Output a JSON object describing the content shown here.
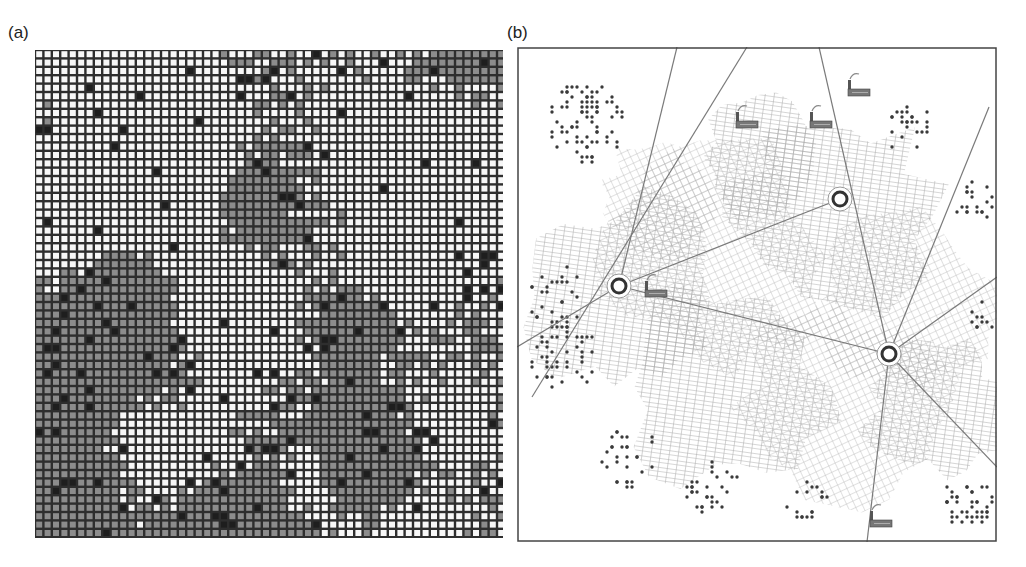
{
  "figure": {
    "panel_a": {
      "label": "(a)",
      "title": "cellular automaton land-use grid",
      "grid": {
        "cols": 56,
        "rows": 58,
        "cell_pitch_px": 8.4,
        "cell_gap_px": 2.4,
        "seed": 7,
        "colors": {
          "border": "#2e2e2e",
          "empty": "#f7f7f7",
          "developed": "#8c8c8c",
          "dense": "#1e1e1e"
        },
        "proportions": {
          "empty": 0.5,
          "developed": 0.44,
          "dense": 0.06
        }
      }
    },
    "panel_b": {
      "label": "(b)",
      "title": "urban growth network map",
      "frame_color": "#444444",
      "mesh_color": "#a8a8a8",
      "dot_color": "#3a3a3a",
      "road_color": "#7a7a7a",
      "centers": [
        {
          "name": "center-west",
          "x": 102,
          "y": 239
        },
        {
          "name": "center-north",
          "x": 323,
          "y": 152
        },
        {
          "name": "center-east",
          "x": 372,
          "y": 307
        }
      ],
      "factories": [
        {
          "name": "factory-1",
          "x": 219,
          "y": 69
        },
        {
          "name": "factory-2",
          "x": 331,
          "y": 37
        },
        {
          "name": "factory-3",
          "x": 293,
          "y": 69
        },
        {
          "name": "factory-4",
          "x": 128,
          "y": 238
        },
        {
          "name": "factory-5",
          "x": 353,
          "y": 468
        }
      ],
      "roads": [
        {
          "from": [
            160,
            0
          ],
          "to": [
            102,
            239
          ]
        },
        {
          "from": [
            230,
            0
          ],
          "to": [
            15,
            350
          ]
        },
        {
          "from": [
            302,
            0
          ],
          "to": [
            372,
            307
          ]
        },
        {
          "from": [
            472,
            60
          ],
          "to": [
            372,
            307
          ]
        },
        {
          "from": [
            102,
            239
          ],
          "to": [
            372,
            307
          ]
        },
        {
          "from": [
            102,
            239
          ],
          "to": [
            323,
            152
          ]
        },
        {
          "from": [
            372,
            307
          ],
          "to": [
            350,
            495
          ]
        },
        {
          "from": [
            372,
            307
          ],
          "to": [
            480,
            420
          ]
        },
        {
          "from": [
            372,
            307
          ],
          "to": [
            480,
            230
          ]
        },
        {
          "from": [
            102,
            239
          ],
          "to": [
            0,
            300
          ]
        }
      ],
      "mesh_blobs": [
        {
          "cx": 110,
          "cy": 250,
          "r": 95
        },
        {
          "cx": 200,
          "cy": 210,
          "r": 110
        },
        {
          "cx": 320,
          "cy": 170,
          "r": 100
        },
        {
          "cx": 390,
          "cy": 260,
          "r": 90
        },
        {
          "cx": 210,
          "cy": 340,
          "r": 100
        },
        {
          "cx": 330,
          "cy": 360,
          "r": 100
        },
        {
          "cx": 420,
          "cy": 360,
          "r": 70
        },
        {
          "cx": 140,
          "cy": 150,
          "r": 55
        },
        {
          "cx": 250,
          "cy": 110,
          "r": 60
        }
      ],
      "dot_clusters": [
        {
          "cx": 70,
          "cy": 75,
          "r": 40,
          "n": 80
        },
        {
          "cx": 40,
          "cy": 250,
          "r": 30,
          "n": 30
        },
        {
          "cx": 45,
          "cy": 310,
          "r": 35,
          "n": 45
        },
        {
          "cx": 110,
          "cy": 410,
          "r": 30,
          "n": 30
        },
        {
          "cx": 195,
          "cy": 440,
          "r": 28,
          "n": 30
        },
        {
          "cx": 290,
          "cy": 455,
          "r": 22,
          "n": 18
        },
        {
          "cx": 390,
          "cy": 80,
          "r": 25,
          "n": 25
        },
        {
          "cx": 455,
          "cy": 155,
          "r": 20,
          "n": 20
        },
        {
          "cx": 450,
          "cy": 455,
          "r": 25,
          "n": 40
        },
        {
          "cx": 465,
          "cy": 270,
          "r": 14,
          "n": 10
        }
      ]
    }
  }
}
